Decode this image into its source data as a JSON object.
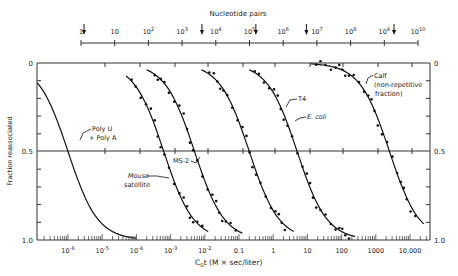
{
  "chart_data": {
    "type": "line",
    "title": "",
    "top_axis": {
      "label": "Nucleotide pairs",
      "ticks": [
        "1",
        "10",
        "10^2",
        "10^3",
        "10^4",
        "10^5",
        "10^6",
        "10^7",
        "10^8",
        "10^9",
        "10^10"
      ],
      "arrows_at_log10": [
        0,
        3.5,
        5.1,
        6.6,
        9.2
      ]
    },
    "xlabel": "C0t (M × sec/liter)",
    "x_scale": "log",
    "x_ticks": [
      "10^-6",
      "10^-5",
      "10^-4",
      "10^-3",
      "10^-2",
      "0.1",
      "1",
      "10",
      "100",
      "1000",
      "10,000"
    ],
    "xlim_log10": [
      -7,
      4.6
    ],
    "ylabel": "Fraction reassociated",
    "y_ticks": [
      "0",
      "0.5",
      "1.0"
    ],
    "ylim": [
      0,
      1.0
    ],
    "y_inverted": true,
    "grid": "horizontal line at 0.5",
    "series": [
      {
        "name": "Poly U + Poly A",
        "midpoint_log10_c0t": -6.0,
        "curve_log10_range": [
          -7,
          -4
        ]
      },
      {
        "name": "Mouse satellite",
        "midpoint_log10_c0t": -3.2,
        "curve_log10_range": [
          -4.3,
          -1.9
        ]
      },
      {
        "name": "MS-2",
        "midpoint_log10_c0t": -2.3,
        "curve_log10_range": [
          -3.7,
          -0.9
        ]
      },
      {
        "name": "T4",
        "midpoint_log10_c0t": -0.7,
        "curve_log10_range": [
          -2.1,
          0.6
        ]
      },
      {
        "name": "E. coli",
        "midpoint_log10_c0t": 0.7,
        "curve_log10_range": [
          -0.7,
          2.4
        ]
      },
      {
        "name": "Calf (non-repetitive fraction)",
        "midpoint_log10_c0t": 3.4,
        "curve_log10_range": [
          1.1,
          4.4
        ]
      }
    ]
  },
  "labels": {
    "top_axis_title": "Nucleotide pairs",
    "y_axis_title": "Fraction reassociated",
    "x_axis_title_c": "C",
    "x_axis_title_sub": "0",
    "x_axis_title_rest": "t (M × sec/liter)",
    "y_left_ticks": [
      "0",
      "0.5",
      "1.0"
    ],
    "y_right_ticks": [
      "0",
      "0.5",
      "1.0"
    ],
    "poly_u": "Poly U",
    "poly_a": "+ Poly A",
    "mouse": "Mouse",
    "satellite": "satellite",
    "ms2": "MS-2",
    "t4": "T4",
    "ecoli": "E. coli",
    "calf1": "Calf",
    "calf2": "(non-repetitive",
    "calf3": "fraction)"
  }
}
